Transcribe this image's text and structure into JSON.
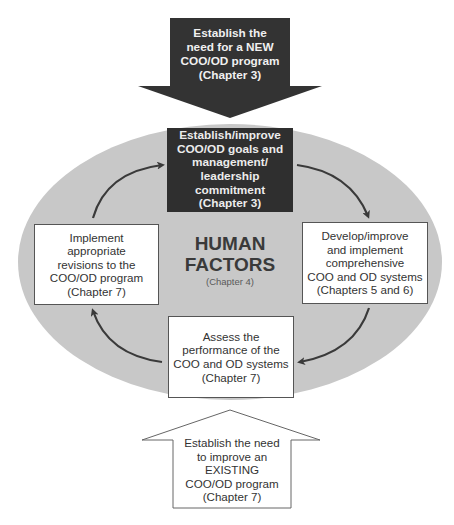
{
  "diagram": {
    "top_arrow": {
      "text": "Establish the\nneed for a NEW\nCOO/OD program\n(Chapter 3)",
      "fill": "#333333"
    },
    "center": {
      "title": "HUMAN\nFACTORS",
      "subtitle": "(Chapter 4)",
      "ellipse_fill": "#c8c8c8"
    },
    "cycle_steps": [
      {
        "position": "top",
        "text": "Establish/improve\nCOO/OD goals and\nmanagement/\nleadership\ncommitment\n(Chapter 3)",
        "style": "dark"
      },
      {
        "position": "right",
        "text": "Develop/improve\nand implement\ncomprehensive\nCOO and OD systems\n(Chapters 5 and 6)",
        "style": "white"
      },
      {
        "position": "bottom",
        "text": "Assess the\nperformance of the\nCOO and OD systems\n(Chapter 7)",
        "style": "white"
      },
      {
        "position": "left",
        "text": "Implement\nappropriate\nrevisions to the\nCOO/OD program\n(Chapter 7)",
        "style": "white"
      }
    ],
    "bottom_arrow": {
      "text": "Establish the need\nto improve an\nEXISTING\nCOO/OD program\n(Chapter 7)",
      "fill": "#ffffff"
    },
    "flow": [
      "top",
      "right",
      "bottom",
      "left",
      "top"
    ]
  }
}
